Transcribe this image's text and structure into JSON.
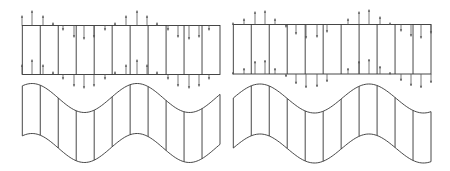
{
  "figure": {
    "width": 450,
    "height": 171,
    "background": "#ffffff",
    "line_color": "#333333",
    "arrow_color": "#555555",
    "panels": [
      {
        "name": "left",
        "rect": {
          "x0": 22.3,
          "x1": 220,
          "y_top": 25.5,
          "y_bottom": 74.5
        },
        "divider_count": 11,
        "arrow_stations_x": [
          22,
          32,
          43,
          53,
          63,
          74,
          84,
          94,
          105,
          115,
          126,
          137,
          147,
          157,
          168,
          178,
          189,
          199,
          209,
          220
        ],
        "arrow_values": [
          10,
          15,
          10,
          3,
          -5,
          -12,
          -14,
          -12,
          -5,
          3,
          10,
          15,
          10,
          3,
          -5,
          -12,
          -14,
          -12,
          -5,
          0
        ],
        "wave": {
          "x0": 22.3,
          "x1": 220,
          "top_mid": 98,
          "bottom_mid": 148,
          "amplitude": 14.5,
          "period": 105,
          "peak_x": 32
        }
      },
      {
        "name": "right",
        "rect": {
          "x0": 233.3,
          "x1": 431,
          "y_top": 24.5,
          "y_bottom": 74
        },
        "divider_count": 11,
        "arrow_stations_x": [
          233,
          244,
          255,
          265,
          275,
          286,
          296,
          306,
          317,
          327,
          338,
          348,
          359,
          369,
          380,
          390,
          401,
          411,
          421,
          431
        ],
        "arrow_values": [
          2,
          6,
          13,
          14,
          6,
          -3,
          -10,
          -14,
          -13,
          -8,
          0,
          6,
          13,
          15,
          8,
          2,
          -7,
          -12,
          -14,
          -9
        ],
        "wave": {
          "x0": 233.3,
          "x1": 431,
          "top_mid": 98.5,
          "bottom_mid": 148.5,
          "amplitude": 14.5,
          "period": 109,
          "peak_x": 260
        }
      }
    ]
  }
}
